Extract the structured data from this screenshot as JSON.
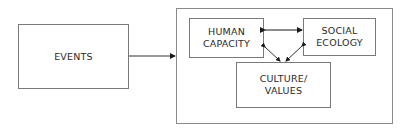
{
  "diagram": {
    "events": {
      "label": "EVENTS"
    },
    "container": {
      "label": ""
    },
    "human_capacity": {
      "line1": "HUMAN",
      "line2": "CAPACITY"
    },
    "social_ecology": {
      "line1": "SOCIAL",
      "line2": "ECOLOGY"
    },
    "culture_values": {
      "line1": "CULTURE/",
      "line2": "VALUES"
    },
    "edges": [
      {
        "from": "EVENTS",
        "to": "container",
        "type": "arrow"
      },
      {
        "from": "HUMAN CAPACITY",
        "to": "SOCIAL ECOLOGY",
        "type": "bidirectional"
      },
      {
        "from": "HUMAN CAPACITY",
        "to": "CULTURE/VALUES",
        "type": "bidirectional"
      },
      {
        "from": "SOCIAL ECOLOGY",
        "to": "CULTURE/VALUES",
        "type": "bidirectional"
      }
    ]
  }
}
